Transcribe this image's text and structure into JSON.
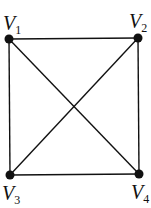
{
  "graph": {
    "title": "Complete graph K4",
    "vertices": [
      {
        "id": "V1",
        "letter": "V",
        "sub": "1",
        "x": 9,
        "y": 39,
        "lx": 3,
        "ly": 31
      },
      {
        "id": "V2",
        "letter": "V",
        "sub": "2",
        "x": 138,
        "y": 38,
        "lx": 129,
        "ly": 29
      },
      {
        "id": "V3",
        "letter": "V",
        "sub": "3",
        "x": 10,
        "y": 175,
        "lx": 2,
        "ly": 201
      },
      {
        "id": "V4",
        "letter": "V",
        "sub": "4",
        "x": 139,
        "y": 174,
        "lx": 131,
        "ly": 200
      }
    ],
    "edges": [
      [
        "V1",
        "V2"
      ],
      [
        "V1",
        "V3"
      ],
      [
        "V1",
        "V4"
      ],
      [
        "V2",
        "V3"
      ],
      [
        "V2",
        "V4"
      ],
      [
        "V3",
        "V4"
      ]
    ],
    "colors": {
      "stroke": "#111111",
      "node": "#111111",
      "background": "#ffffff"
    }
  }
}
